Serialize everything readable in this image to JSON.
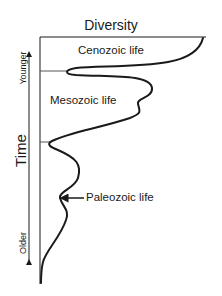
{
  "title": "Diversity",
  "axis": {
    "vertical_label": "Time",
    "top_label": "Younger",
    "bottom_label": "Older"
  },
  "eras": [
    {
      "name": "Cenozoic",
      "label": "Cenozoic life"
    },
    {
      "name": "Mesozoic",
      "label": "Mesozoic life"
    },
    {
      "name": "Paleozoic",
      "label": "Paleozoic life"
    }
  ],
  "colors": {
    "line": "#1a1a1a",
    "divider": "#555555",
    "background": "#ffffff"
  }
}
